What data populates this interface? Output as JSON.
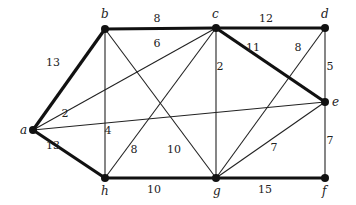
{
  "graph": {
    "nodes": [
      {
        "id": "a",
        "label": "a",
        "x": 33,
        "y": 130,
        "lx": 20,
        "ly": 134
      },
      {
        "id": "b",
        "label": "b",
        "x": 105,
        "y": 29,
        "lx": 101,
        "ly": 18
      },
      {
        "id": "c",
        "label": "c",
        "x": 216,
        "y": 28,
        "lx": 212,
        "ly": 18
      },
      {
        "id": "d",
        "label": "d",
        "x": 325,
        "y": 28,
        "lx": 321,
        "ly": 18
      },
      {
        "id": "e",
        "label": "e",
        "x": 325,
        "y": 102,
        "lx": 332,
        "ly": 106
      },
      {
        "id": "f",
        "label": "f",
        "x": 325,
        "y": 178,
        "lx": 322,
        "ly": 195
      },
      {
        "id": "g",
        "label": "g",
        "x": 216,
        "y": 178,
        "lx": 213,
        "ly": 195
      },
      {
        "id": "h",
        "label": "h",
        "x": 105,
        "y": 178,
        "lx": 101,
        "ly": 195
      }
    ],
    "edges": [
      {
        "from": "a",
        "to": "b",
        "weight": "13",
        "bold": true,
        "wx": 53,
        "wy": 66
      },
      {
        "from": "b",
        "to": "c",
        "weight": "8",
        "bold": true,
        "wx": 157,
        "wy": 22
      },
      {
        "from": "c",
        "to": "d",
        "weight": "12",
        "bold": true,
        "wx": 266,
        "wy": 22
      },
      {
        "from": "c",
        "to": "e",
        "weight": "11",
        "bold": true,
        "wx": 253,
        "wy": 51
      },
      {
        "from": "a",
        "to": "h",
        "weight": "13",
        "bold": true,
        "wx": 53,
        "wy": 149
      },
      {
        "from": "h",
        "to": "g",
        "weight": "10",
        "bold": true,
        "wx": 154,
        "wy": 193
      },
      {
        "from": "g",
        "to": "f",
        "weight": "15",
        "bold": true,
        "wx": 265,
        "wy": 193
      },
      {
        "from": "a",
        "to": "c",
        "weight": "6",
        "bold": false,
        "wx": 157,
        "wy": 47
      },
      {
        "from": "a",
        "to": "e",
        "weight": "2",
        "bold": false,
        "wx": 65,
        "wy": 117
      },
      {
        "from": "b",
        "to": "h",
        "weight": "4",
        "bold": false,
        "wx": 108,
        "wy": 134
      },
      {
        "from": "b",
        "to": "g",
        "weight": "10",
        "bold": false,
        "wx": 174,
        "wy": 153
      },
      {
        "from": "c",
        "to": "g",
        "weight": "2",
        "bold": false,
        "wx": 220,
        "wy": 70
      },
      {
        "from": "c",
        "to": "h",
        "weight": "8",
        "bold": false,
        "wx": 134,
        "wy": 153
      },
      {
        "from": "d",
        "to": "g",
        "weight": "8",
        "bold": false,
        "wx": 298,
        "wy": 51
      },
      {
        "from": "d",
        "to": "e",
        "weight": "5",
        "bold": false,
        "wx": 330,
        "wy": 70
      },
      {
        "from": "e",
        "to": "g",
        "weight": "7",
        "bold": false,
        "wx": 274,
        "wy": 151
      },
      {
        "from": "e",
        "to": "f",
        "weight": "7",
        "bold": false,
        "wx": 330,
        "wy": 144
      }
    ]
  }
}
